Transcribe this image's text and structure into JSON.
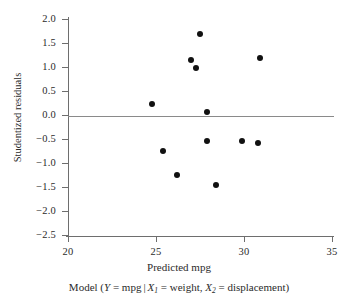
{
  "chart_data": {
    "type": "scatter",
    "title": "",
    "xlabel": "Predicted mpg",
    "ylabel": "Studentized residuals",
    "caption": "Model (Y = mpg | X1 = weight, X2 = displacement)",
    "xlim": [
      20,
      35
    ],
    "ylim": [
      -2.5,
      2.0
    ],
    "xticks": [
      20,
      25,
      30,
      35
    ],
    "xtick_labels": [
      "20",
      "25",
      "30",
      "35"
    ],
    "yticks": [
      2.0,
      1.5,
      1.0,
      0.5,
      0.0,
      -0.5,
      -1.0,
      -1.5,
      -2.0,
      -2.5
    ],
    "ytick_labels": [
      "2.0",
      "1.5",
      "1.0",
      "0.5",
      "0.0",
      "−0.5",
      "−1.0",
      "−1.5",
      "−2.0",
      "−2.5"
    ],
    "grid": false,
    "legend": "none",
    "reference_line": {
      "orientation": "horizontal",
      "value": 0.0,
      "color": "#8a8a8a"
    },
    "marker": {
      "shape": "circle",
      "color": "#111111",
      "size": 6
    },
    "points": [
      {
        "x": 24.8,
        "y": 0.22
      },
      {
        "x": 25.4,
        "y": -0.75
      },
      {
        "x": 26.2,
        "y": -1.26
      },
      {
        "x": 27.0,
        "y": 1.15
      },
      {
        "x": 27.3,
        "y": 0.97
      },
      {
        "x": 27.5,
        "y": 1.68
      },
      {
        "x": 27.9,
        "y": 0.06
      },
      {
        "x": 27.9,
        "y": -0.54
      },
      {
        "x": 28.4,
        "y": -1.45
      },
      {
        "x": 29.9,
        "y": -0.54
      },
      {
        "x": 30.8,
        "y": -0.59
      },
      {
        "x": 30.9,
        "y": 1.18
      }
    ]
  },
  "caption_parts": {
    "model_open": "Model (",
    "y_var": "Y",
    "eq1": " = mpg",
    "bar": "|",
    "x1_var": "X",
    "x1_sub": "1",
    "eq2": " = weight, ",
    "x2_var": "X",
    "x2_sub": "2",
    "eq3": " = displacement)"
  },
  "colors": {
    "axis": "#6e6e6e",
    "zero_line": "#8a8a8a",
    "marker": "#111111",
    "text": "#2b2b2b",
    "background": "#ffffff"
  }
}
